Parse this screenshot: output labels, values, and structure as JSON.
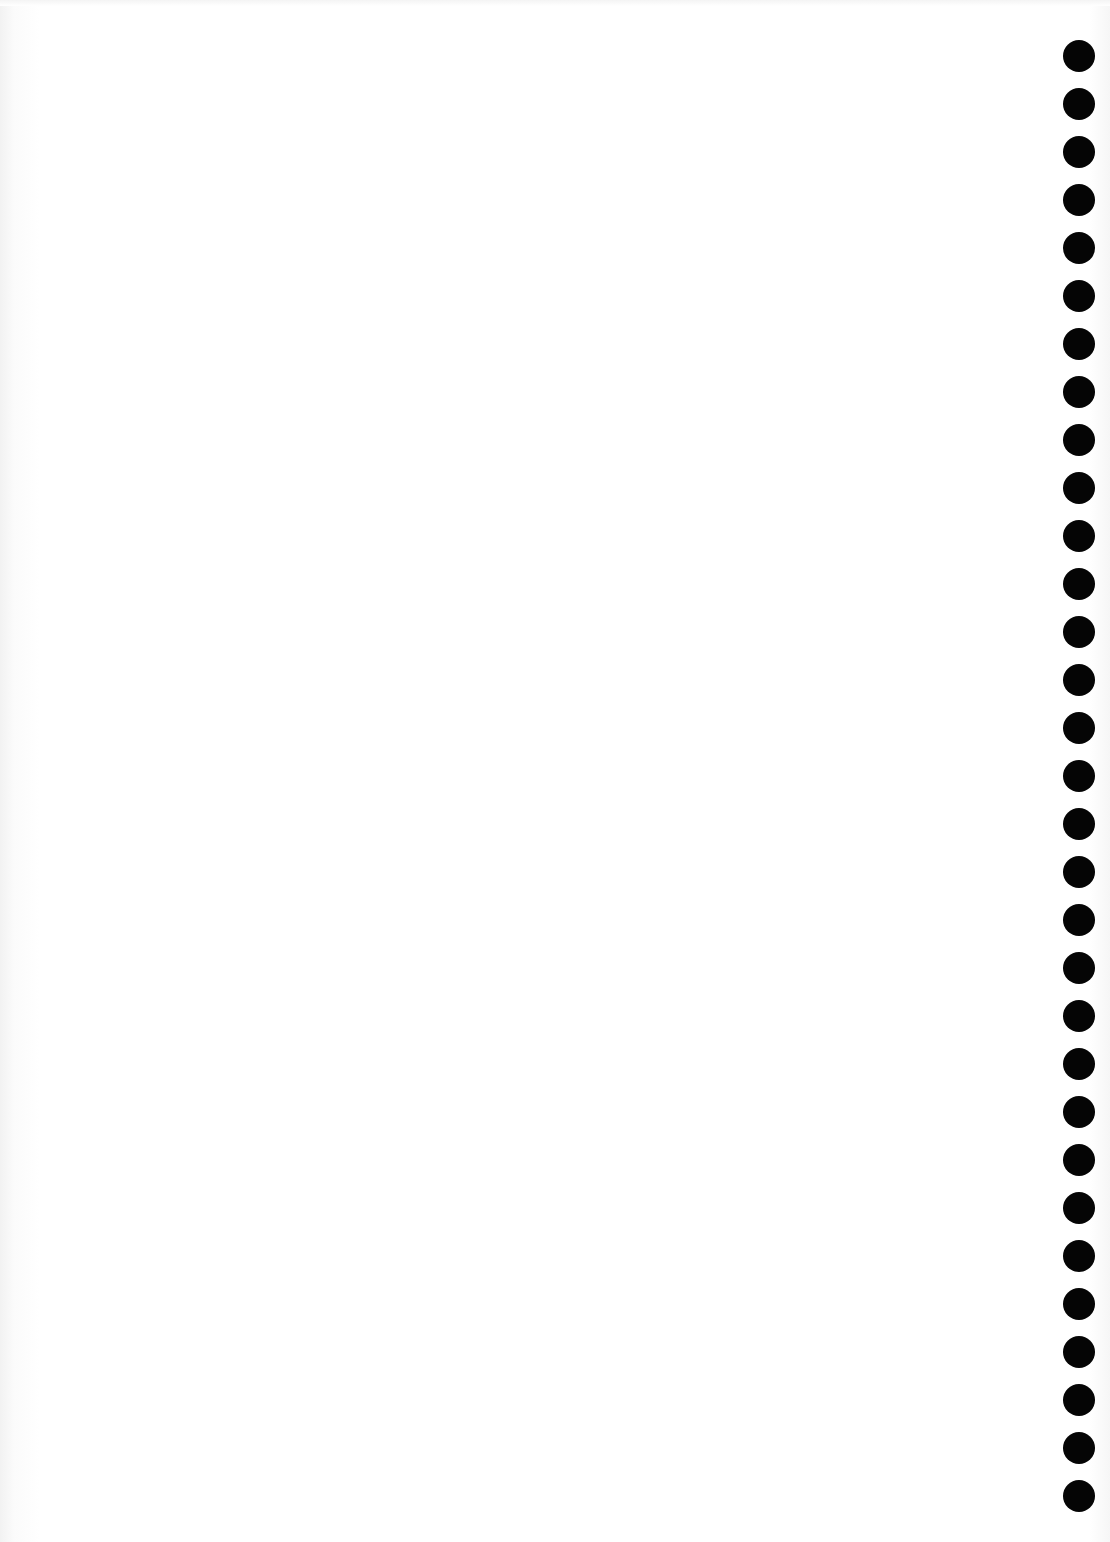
{
  "page": {
    "type": "blank notebook page",
    "background_color": "#ffffff",
    "content_text": ""
  },
  "binding": {
    "side": "right",
    "hole_count": 31,
    "hole_color": "#050505",
    "hole_icon": "binding-hole-icon"
  }
}
